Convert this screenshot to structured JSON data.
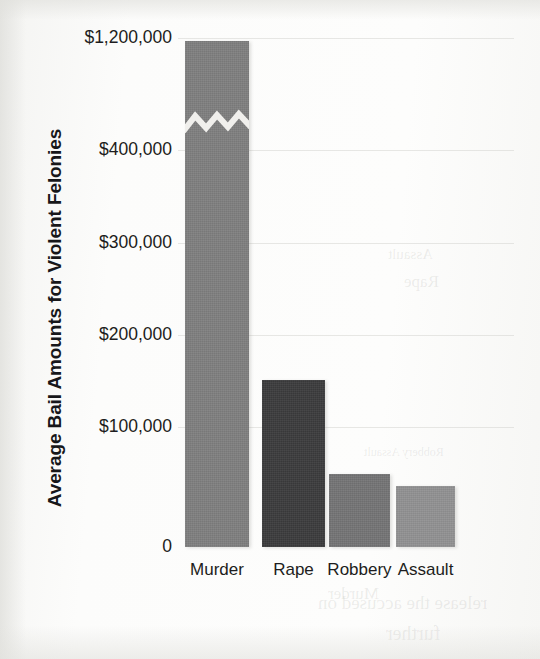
{
  "chart_data": {
    "type": "bar",
    "title": "",
    "xlabel": "",
    "ylabel": "Average Bail Amounts for Violent Felonies",
    "categories": [
      "Murder",
      "Rape",
      "Robbery",
      "Assault"
    ],
    "values": [
      1180000,
      170000,
      83000,
      70000
    ],
    "value_labels": [
      "",
      "",
      "",
      ""
    ],
    "bar_colors": [
      "#7f7f7f",
      "#3b3b3c",
      "#747475",
      "#919192"
    ],
    "ytick_labels": [
      "$1,200,000",
      "$400,000",
      "$300,000",
      "$200,000",
      "$100,000",
      "0"
    ],
    "ytick_values": [
      1200000,
      400000,
      300000,
      200000,
      100000,
      0
    ],
    "ytick_y_px": [
      38,
      150,
      243,
      335,
      427,
      547
    ],
    "ylim": [
      0,
      1200000
    ],
    "axis_break": {
      "present": true,
      "between": [
        400000,
        1200000
      ],
      "on_series": "Murder",
      "style": "zigzag"
    },
    "grid": false,
    "legend": false,
    "legend_position": "none"
  },
  "bars": [
    {
      "label": "Murder",
      "left": 185,
      "width": 64,
      "top": 41,
      "color": "#7f7f7f",
      "has_break": true,
      "break_y": 122
    },
    {
      "label": "Rape",
      "left": 262,
      "width": 63,
      "top": 380,
      "color": "#3b3b3c",
      "has_break": false,
      "break_y": 0
    },
    {
      "label": "Robbery",
      "left": 329,
      "width": 61,
      "top": 474,
      "color": "#747475",
      "has_break": false,
      "break_y": 0
    },
    {
      "label": "Assault",
      "left": 396,
      "width": 59,
      "top": 486,
      "color": "#919192",
      "has_break": false,
      "break_y": 0
    }
  ],
  "baseline_y": 547,
  "xtick_y": 560,
  "bleed_through": [
    {
      "text": "Assault",
      "left": 388,
      "top": 246,
      "size": 15
    },
    {
      "text": "Rape",
      "left": 404,
      "top": 272,
      "size": 17
    },
    {
      "text": "release the accused on",
      "left": 318,
      "top": 592,
      "size": 19
    },
    {
      "text": "further",
      "left": 386,
      "top": 622,
      "size": 20
    },
    {
      "text": "Robbery Assault",
      "left": 364,
      "top": 445,
      "size": 12
    },
    {
      "text": "Murder",
      "left": 328,
      "top": 584,
      "size": 17
    }
  ]
}
